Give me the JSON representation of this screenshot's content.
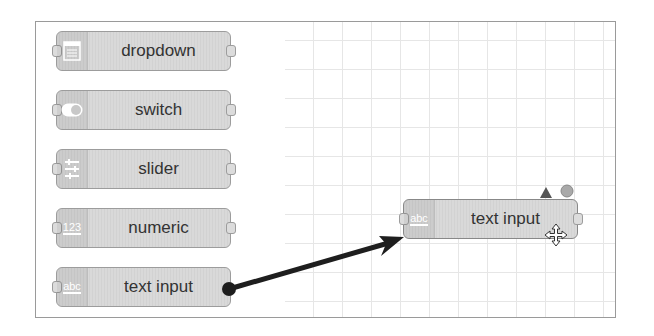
{
  "palette": {
    "nodes": [
      {
        "label": "dropdown",
        "icon": "list-icon"
      },
      {
        "label": "switch",
        "icon": "toggle-icon"
      },
      {
        "label": "slider",
        "icon": "sliders-icon"
      },
      {
        "label": "numeric",
        "icon": "number-icon",
        "icon_text": "123"
      },
      {
        "label": "text input",
        "icon": "text-icon",
        "icon_text": "abc"
      }
    ]
  },
  "workspace": {
    "node": {
      "label": "text input",
      "icon": "text-icon",
      "icon_text": "abc",
      "changed_indicator": "triangle",
      "status_indicator": "circle"
    },
    "cursor": "move-cursor"
  },
  "colors": {
    "node_fill": "#d9d9d9",
    "wire": "#1e1e1e",
    "grid": "#e6e6e6",
    "border": "#9a9a9a"
  }
}
